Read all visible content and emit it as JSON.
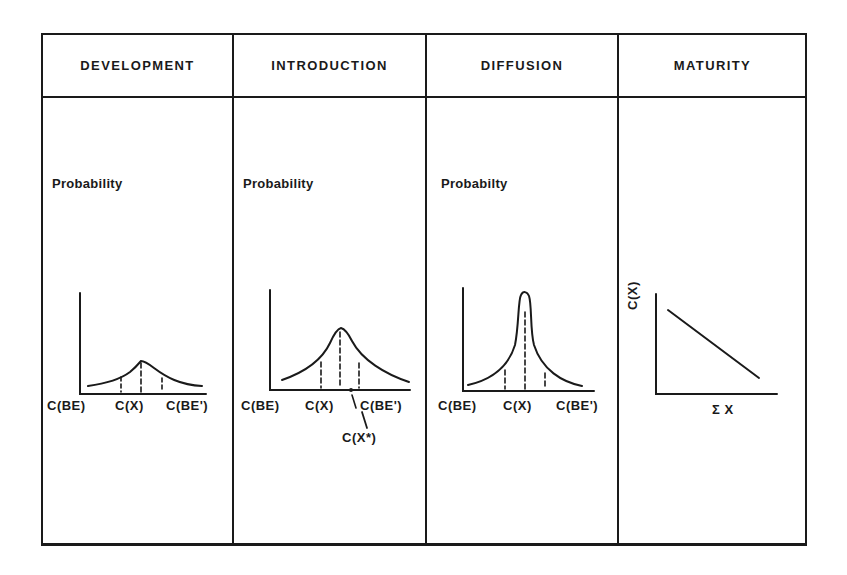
{
  "columns": [
    {
      "title": "DEVELOPMENT",
      "ylabel": "Probability",
      "xlabels": {
        "left": "C(BE)",
        "mid": "C(X)",
        "right": "C(BE')"
      },
      "curve": "wide-flat-normal"
    },
    {
      "title": "INTRODUCTION",
      "ylabel": "Probability",
      "xlabels": {
        "left": "C(BE)",
        "mid": "C(X)",
        "right": "C(BE')"
      },
      "annotation": "C(X*)",
      "curve": "medium-peaked"
    },
    {
      "title": "DIFFUSION",
      "ylabel": "Probabilty",
      "xlabels": {
        "left": "C(BE)",
        "mid": "C(X)",
        "right": "C(BE')"
      },
      "curve": "narrow-tall-peak"
    },
    {
      "title": "MATURITY",
      "ylabel": "C(X)",
      "xlabel": "Σ X",
      "curve": "declining-line"
    }
  ],
  "colors": {
    "ink": "#1a1a1a",
    "background": "#ffffff"
  }
}
